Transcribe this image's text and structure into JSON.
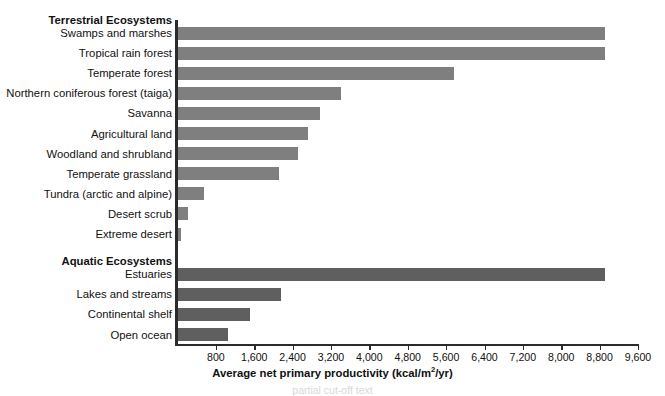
{
  "chart_data": {
    "type": "bar",
    "orientation": "horizontal",
    "title": "",
    "xlabel": "Average net primary productivity (kcal/m²/yr)",
    "xlabel_main": "Average net primary productivity (kcal/m",
    "xlabel_sup": "2",
    "xlabel_tail": "/yr)",
    "ylabel": "",
    "xlim": [
      0,
      9600
    ],
    "grid": false,
    "legend": "none",
    "tick_labels": [
      "800",
      "1,600",
      "2,400",
      "3,200",
      "4,000",
      "4,800",
      "5,600",
      "6,400",
      "7,200",
      "8,000",
      "8,800",
      "9,600"
    ],
    "tick_values": [
      800,
      1600,
      2400,
      3200,
      4000,
      4800,
      5600,
      6400,
      7200,
      8000,
      8800,
      9600
    ],
    "sections": [
      {
        "name": "Terrestrial Ecosystems",
        "color": "#7f7f7f",
        "categories": [
          "Swamps and marshes",
          "Tropical rain forest",
          "Temperate forest",
          "Northern coniferous forest (taiga)",
          "Savanna",
          "Agricultural land",
          "Woodland and shrubland",
          "Temperate grassland",
          "Tundra (arctic and alpine)",
          "Desert scrub",
          "Extreme desert"
        ],
        "values": [
          8900,
          8900,
          5750,
          3400,
          2950,
          2700,
          2500,
          2100,
          550,
          200,
          60
        ]
      },
      {
        "name": "Aquatic Ecosystems",
        "color": "#5f5f5f",
        "categories": [
          "Estuaries",
          "Lakes and streams",
          "Continental shelf",
          "Open ocean"
        ],
        "values": [
          8900,
          2150,
          1500,
          1050
        ]
      }
    ]
  },
  "caption": {
    "text": "partial cut-off text"
  },
  "colors": {
    "terrestrial_bar": "#7f7f7f",
    "aquatic_bar": "#5f5f5f",
    "axis": "#2b2b2b",
    "background": "#ffffff"
  }
}
